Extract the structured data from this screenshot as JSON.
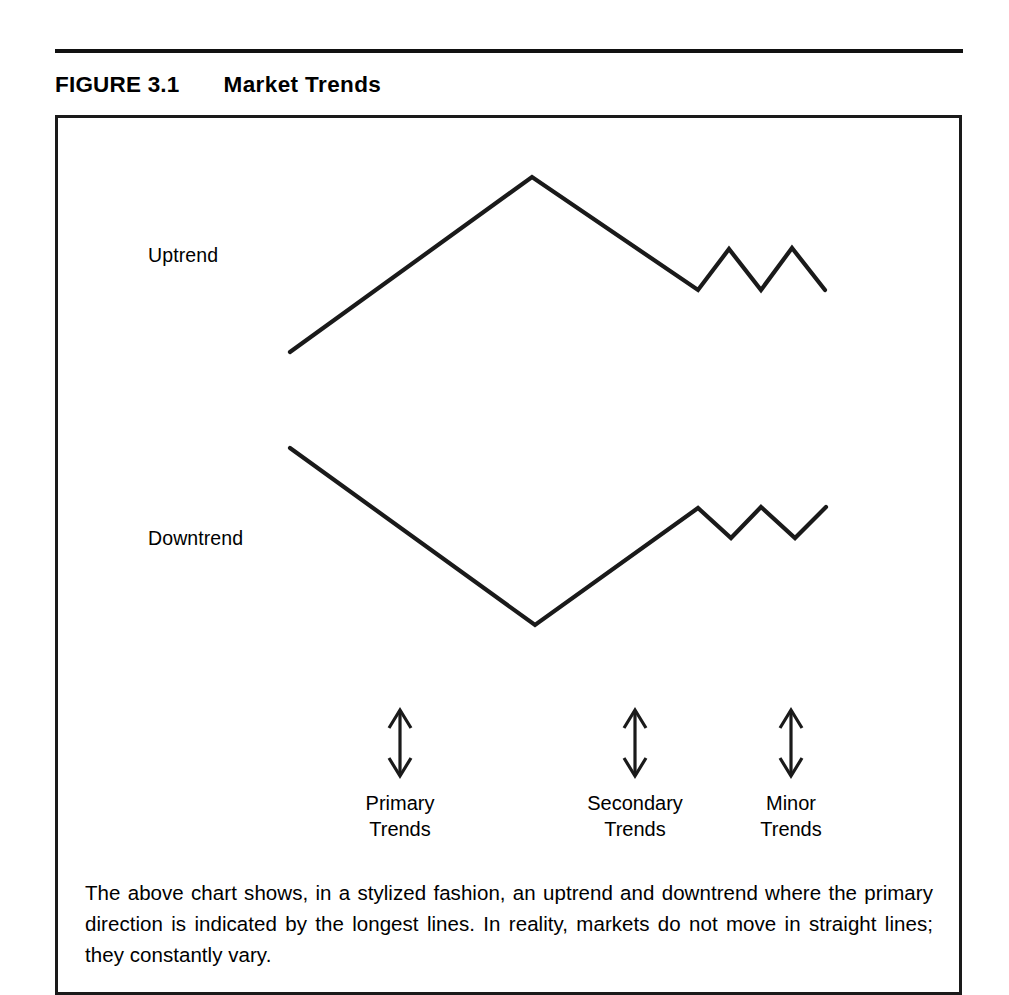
{
  "figure": {
    "label": "FIGURE 3.1",
    "title": "Market Trends",
    "caption": "The above chart shows, in a stylized fashion, an uptrend and downtrend where the primary direction is indicated by the longest lines. In reality, markets do not move in straight lines; they constantly vary."
  },
  "labels": {
    "uptrend": "Uptrend",
    "downtrend": "Downtrend"
  },
  "spans": [
    {
      "name": "primary",
      "line1": "Primary",
      "line2": "Trends",
      "center_x": 400
    },
    {
      "name": "secondary",
      "line1": "Secondary",
      "line2": "Trends",
      "center_x": 635
    },
    {
      "name": "minor",
      "line1": "Minor",
      "line2": "Trends",
      "center_x": 791
    }
  ],
  "colors": {
    "ink": "#1a1a1a",
    "paper": "#ffffff",
    "rule": "#111111"
  },
  "chart_data": {
    "type": "line",
    "title": "Market Trends",
    "xlabel": "",
    "ylabel": "",
    "grid": false,
    "legend": "none",
    "axis_visible": false,
    "note": "Stylized schematic of an uptrend and a downtrend, annotated with primary, secondary and minor trend spans. Coordinates are in screenshot pixel space (y increases downward).",
    "series": [
      {
        "name": "Uptrend",
        "description": "Long rise to a peak, long decline, then a minor zigzag of lower highs.",
        "points": [
          [
            290,
            352
          ],
          [
            532,
            177
          ],
          [
            698,
            290
          ],
          [
            729,
            249
          ],
          [
            761,
            290
          ],
          [
            792,
            248
          ],
          [
            825,
            290
          ]
        ]
      },
      {
        "name": "Downtrend",
        "description": "Long decline to a trough, long rise, then a minor zigzag of higher lows.",
        "points": [
          [
            290,
            448
          ],
          [
            535,
            625
          ],
          [
            698,
            508
          ],
          [
            731,
            538
          ],
          [
            761,
            507
          ],
          [
            795,
            538
          ],
          [
            826,
            507
          ]
        ]
      }
    ],
    "annotations": [
      {
        "label": "Primary Trends",
        "type": "double-arrow",
        "x": 400,
        "y_top": 710,
        "y_bottom": 776
      },
      {
        "label": "Secondary Trends",
        "type": "double-arrow",
        "x": 635,
        "y_top": 710,
        "y_bottom": 776
      },
      {
        "label": "Minor Trends",
        "type": "double-arrow",
        "x": 791,
        "y_top": 710,
        "y_bottom": 776
      }
    ]
  }
}
